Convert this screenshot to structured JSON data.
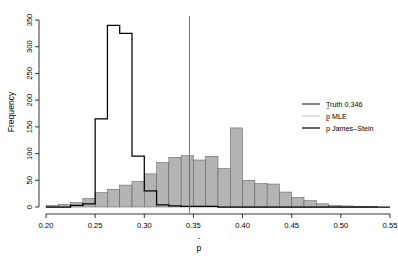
{
  "chart_data": {
    "type": "bar",
    "title": "",
    "xlabel": "p̂",
    "ylabel": "Frequency",
    "xlim": [
      0.2,
      0.55
    ],
    "ylim": [
      0,
      350
    ],
    "grid": false,
    "bin_width": 0.0125,
    "legend_position": "right",
    "xticks": [
      "0.20",
      "0.25",
      "0.30",
      "0.35",
      "0.40",
      "0.45",
      "0.50",
      "0.55"
    ],
    "xtick_values": [
      0.2,
      0.25,
      0.3,
      0.35,
      0.4,
      0.45,
      0.5,
      0.55
    ],
    "yticks": [
      "0",
      "50",
      "100",
      "150",
      "200",
      "250",
      "300",
      "350"
    ],
    "ytick_values": [
      0,
      50,
      100,
      150,
      200,
      250,
      300,
      350
    ],
    "annotations": [
      {
        "name": "truth-line",
        "type": "vline",
        "x": 0.346,
        "label": "Truth 0.346"
      }
    ],
    "series": [
      {
        "name": "p̂ MLE",
        "style": "filled-bars",
        "color": "#b4b4b4",
        "edge_color": "#555555",
        "bin_starts": [
          0.2,
          0.2125,
          0.225,
          0.2375,
          0.25,
          0.2625,
          0.275,
          0.2875,
          0.3,
          0.3125,
          0.325,
          0.3375,
          0.35,
          0.3625,
          0.375,
          0.3875,
          0.4,
          0.4125,
          0.425,
          0.4375,
          0.45,
          0.4625,
          0.475,
          0.4875,
          0.5,
          0.5125,
          0.525,
          0.5375
        ],
        "values": [
          3,
          5,
          8,
          16,
          27,
          33,
          41,
          48,
          62,
          83,
          93,
          96,
          88,
          95,
          72,
          148,
          50,
          44,
          43,
          28,
          18,
          12,
          6,
          3,
          2,
          1,
          1,
          0
        ]
      },
      {
        "name": "p̂ James–Stein",
        "style": "outline-steps",
        "color": "#000000",
        "bin_starts": [
          0.2,
          0.2125,
          0.225,
          0.2375,
          0.25,
          0.2625,
          0.275,
          0.2875,
          0.3,
          0.3125,
          0.325,
          0.3375,
          0.35,
          0.3625,
          0.375,
          0.3875,
          0.4,
          0.4125,
          0.425,
          0.4375,
          0.45,
          0.4625,
          0.475,
          0.4875,
          0.5,
          0.5125,
          0.525,
          0.5375
        ],
        "values": [
          0,
          0,
          3,
          6,
          165,
          340,
          325,
          95,
          30,
          4,
          2,
          1,
          1,
          1,
          0,
          0,
          0,
          0,
          0,
          0,
          0,
          0,
          0,
          0,
          0,
          0,
          0,
          0
        ]
      }
    ]
  },
  "legend": {
    "items": [
      {
        "label": "Truth 0.346",
        "color": "#333333",
        "name": "legend-truth"
      },
      {
        "label": "p̂ MLE",
        "color": "#c8c8c8",
        "name": "legend-mle"
      },
      {
        "label": "p̂ James–Stein",
        "color": "#000000",
        "name": "legend-js"
      }
    ]
  },
  "axes": {
    "y_title": "Frequency",
    "x_title": "p̂"
  }
}
